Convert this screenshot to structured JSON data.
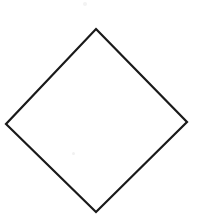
{
  "canvas": {
    "width": 202,
    "height": 217,
    "background_color": "#ffffff"
  },
  "figure": {
    "name": "diamond-outline",
    "shape_type": "diamond",
    "fill_color": "#ffffff",
    "stroke_color": "#1a1a1a",
    "stroke_width": 2.2,
    "closed": true,
    "vertices": [
      {
        "label": "top",
        "x": 96,
        "y": 29
      },
      {
        "label": "right",
        "x": 187,
        "y": 122
      },
      {
        "label": "bottom",
        "x": 96,
        "y": 212
      },
      {
        "label": "left",
        "x": 6,
        "y": 124
      }
    ],
    "edges": [
      {
        "label": "top-right-edge",
        "from": "top",
        "to": "right"
      },
      {
        "label": "bottom-right-edge",
        "from": "right",
        "to": "bottom"
      },
      {
        "label": "bottom-left-edge",
        "from": "bottom",
        "to": "left"
      },
      {
        "label": "top-left-edge",
        "from": "left",
        "to": "top"
      }
    ],
    "path": "M 96 29 L 187 122 L 96 212 L 6 124 Z"
  },
  "artifacts": [
    {
      "name": "scan-speck-top",
      "x": 83,
      "y": 2,
      "size": 4,
      "color": "#f3f3f3"
    },
    {
      "name": "scan-speck-interior",
      "x": 72,
      "y": 152,
      "size": 3,
      "color": "#f1f1f1"
    }
  ]
}
